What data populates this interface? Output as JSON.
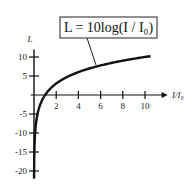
{
  "chart_data": {
    "type": "line",
    "title": "",
    "annotation": "L = 10log(I / I₀)",
    "xlabel": "I/I₀",
    "ylabel": "L",
    "xlim": [
      0,
      11.5
    ],
    "ylim": [
      -22,
      12
    ],
    "x_ticks": [
      2,
      4,
      6,
      8,
      10
    ],
    "x_tick_labels": [
      "2",
      "4",
      "6",
      "8",
      "10"
    ],
    "y_ticks": [
      10,
      5,
      -5,
      -10,
      -15,
      -20
    ],
    "y_tick_labels": [
      "10",
      "5",
      "-5",
      "-10",
      "-15",
      "-20"
    ],
    "grid": false,
    "series": [
      {
        "name": "L = 10log(I/I0)",
        "function": "10*log10(x)",
        "x_range": [
          0.006,
          10.5
        ],
        "color": "#111111"
      }
    ]
  }
}
